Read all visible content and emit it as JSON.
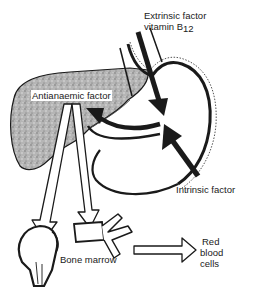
{
  "diagram": {
    "labels": {
      "extrinsic_line1": "Extrinsic factor",
      "extrinsic_line2": "vitamin B",
      "extrinsic_subscript": "12",
      "antianaemic": "Antianaemic factor",
      "intrinsic": "Intrinsic factor",
      "bone_marrow": "Bone marrow",
      "rbc_line1": "Red",
      "rbc_line2": "blood",
      "rbc_line3": "cells"
    },
    "nodes": [
      {
        "id": "liver",
        "label": "Liver (stippled organ, left)"
      },
      {
        "id": "stomach",
        "label": "Stomach (outlined organ, right)"
      },
      {
        "id": "femur-head",
        "label": "Bone (femur head)"
      },
      {
        "id": "vertebra",
        "label": "Bone (vertebra)"
      }
    ],
    "edges": [
      {
        "from": "Extrinsic factor vitamin B12",
        "to": "stomach"
      },
      {
        "from": "Intrinsic factor",
        "to": "stomach"
      },
      {
        "from": "stomach",
        "to": "liver",
        "label": "Antianaemic factor"
      },
      {
        "from": "liver",
        "to": "femur-head"
      },
      {
        "from": "liver",
        "to": "vertebra"
      },
      {
        "from": "Bone marrow",
        "to": "Red blood cells"
      }
    ],
    "colors": {
      "ink": "#1a1a1a",
      "liver_fill": "#a9a9a9",
      "background": "#ffffff"
    }
  }
}
